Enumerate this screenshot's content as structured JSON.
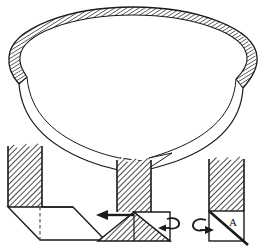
{
  "figure": {
    "title": "",
    "background_color": "#ffffff",
    "line_color": "#1a1a1a",
    "hatch_color": "#2b2b2b",
    "width": 265,
    "height": 248,
    "parts": [
      {
        "id": "ring",
        "name": "split-ring-band",
        "description": "Perspective view of an open circular band (split ring) with hatched outer surface and a gap at the front",
        "hatched": true,
        "gap_location": "front-bottom-center"
      },
      {
        "id": "step-1",
        "name": "fold-step-1",
        "description": "Vertical hatched strip standing on a horizontal plane shown as a parallelogram, with dashed fold reference line",
        "label": ""
      },
      {
        "id": "step-2",
        "name": "fold-step-2",
        "description": "Strip end folded into a triangle with a straight translation arrow pointing left and a curved rotation arrow at the right",
        "label": ""
      },
      {
        "id": "step-3",
        "name": "fold-step-3",
        "description": "Folded square face with diagonal crease, region marked A, and a curved rotation arrow at the left",
        "label": ""
      }
    ]
  },
  "annotations": {
    "region_a_label": "A",
    "arrow_left_name": "translation-arrow-left",
    "rotation_arrow_right_name": "rotation-arrow-right",
    "rotation_arrow_left_name": "rotation-arrow-left"
  },
  "colors": {
    "ink": "#1a1a1a",
    "hatch": "#2b2b2b",
    "paper": "#ffffff",
    "dashed": "#555555"
  }
}
